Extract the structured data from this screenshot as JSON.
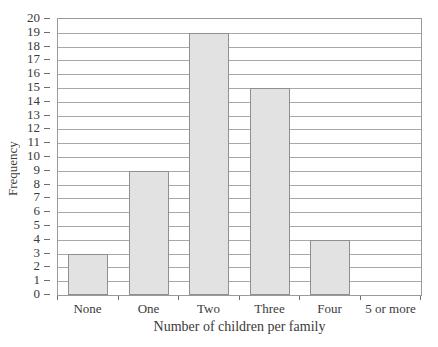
{
  "chart_data": {
    "type": "bar",
    "title": "",
    "xlabel": "Number of children per family",
    "ylabel": "Frequency",
    "categories": [
      "None",
      "One",
      "Two",
      "Three",
      "Four",
      "5 or more"
    ],
    "values": [
      3,
      9,
      19,
      15,
      4,
      0
    ],
    "ylim": [
      0,
      20
    ],
    "ytick_labels": [
      "0",
      "1",
      "2",
      "3",
      "4",
      "5",
      "6",
      "7",
      "8",
      "9",
      "10",
      "11",
      "12",
      "13",
      "14",
      "15",
      "16",
      "17",
      "18",
      "19",
      "20"
    ],
    "ytick_step": 1,
    "grid": true,
    "grid_axis": "y",
    "legend": false,
    "bar_fill_color": "#e2e2e2",
    "bar_border_color": "#8f8f8f",
    "grid_color": "#a8a8a8",
    "frame_color": "#9a9a9a",
    "text_color": "#3a3a3a"
  }
}
